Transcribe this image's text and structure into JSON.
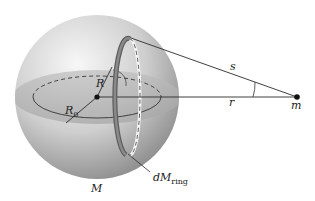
{
  "diagram": {
    "colors": {
      "sphere_light": "#f2f2f2",
      "sphere_dark": "#8a8a8a",
      "band": "#b8b8b8",
      "ring": "#6e6e6e",
      "line": "#2a2a2a"
    },
    "labels": {
      "s": "s",
      "r": "r",
      "m": "m",
      "R": "R",
      "R0_main": "R",
      "R0_sub": "0",
      "M": "M",
      "dM_main": "dM",
      "dM_sub": "ring"
    }
  }
}
